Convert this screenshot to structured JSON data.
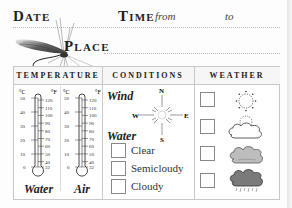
{
  "header": {
    "date_label": "Date",
    "time_label": "Time",
    "from_label": "from",
    "to_label": "to",
    "place_label": "Place"
  },
  "table": {
    "columns": [
      "TEMPERATURE",
      "CONDITIONS",
      "WEATHER"
    ],
    "temperature": {
      "thermometers": [
        {
          "label": "Water",
          "celsius_unit": "°C",
          "fahrenheit_unit": "°F"
        },
        {
          "label": "Air",
          "celsius_unit": "°C",
          "fahrenheit_unit": "°F"
        }
      ],
      "celsius_ticks": [
        "50",
        "40",
        "30",
        "20",
        "10",
        "0"
      ],
      "fahrenheit_ticks": [
        "120",
        "110",
        "100",
        "90",
        "80",
        "70",
        "60",
        "50",
        "40",
        "32"
      ]
    },
    "conditions": {
      "wind_label": "Wind",
      "compass": {
        "n": "N",
        "s": "S",
        "e": "E",
        "w": "W"
      },
      "water_label": "Water",
      "water_options": [
        "Clear",
        "Semicloudy",
        "Cloudy"
      ]
    },
    "weather": {
      "options": [
        "sunny",
        "partly-cloudy",
        "overcast",
        "rain"
      ]
    }
  },
  "colors": {
    "border": "#c8c8c8",
    "checkbox_border": "#888888",
    "cloud_light": "#bdbdbd",
    "cloud_dark": "#7a7a7a"
  }
}
